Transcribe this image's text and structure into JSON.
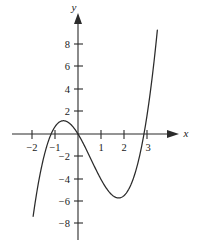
{
  "figure": {
    "background_color": "#ffffff",
    "line_color": "#2b2b2b",
    "axis_color": "#2b2b2b"
  },
  "axes": {
    "x_label": "x",
    "y_label": "y",
    "origin_px": {
      "x": 78,
      "y": 134
    },
    "px_per_unit_x": 23.0,
    "px_per_unit_y": 11.2
  },
  "chart_data": {
    "type": "line",
    "title": "",
    "xlabel": "x",
    "ylabel": "y",
    "grid": false,
    "legend": "none",
    "xlim": [
      -2.1,
      3.7
    ],
    "ylim": [
      -8.6,
      9.4
    ],
    "xticks": [
      -2,
      -1,
      1,
      2,
      3
    ],
    "xtick_labels": [
      "−2",
      "−1",
      "1",
      "2",
      "3"
    ],
    "yticks": [
      8,
      6,
      4,
      2,
      -2,
      -4,
      -6,
      -8
    ],
    "ytick_labels": [
      "8",
      "6",
      "4",
      "2",
      "−2",
      "−4",
      "−6",
      "−8"
    ],
    "series": [
      {
        "name": "cubic",
        "equation": "y = x^3 - 1.7x^2 - 3.35x",
        "domain": [
          -1.95,
          3.45
        ],
        "roots": [
          -1.17,
          0,
          2.87
        ],
        "local_maximum": {
          "x": -0.55,
          "y": 1.1
        },
        "local_minimum": {
          "x": 1.9,
          "y": -6.3
        },
        "x": [
          -1.95,
          -1.8,
          -1.6,
          -1.4,
          -1.17,
          -1.0,
          -0.8,
          -0.55,
          -0.3,
          0.0,
          0.3,
          0.6,
          1.0,
          1.4,
          1.9,
          2.2,
          2.5,
          2.87,
          3.1,
          3.3,
          3.45
        ],
        "y": [
          -7.9,
          -5.8,
          -3.7,
          -2.0,
          0.0,
          0.65,
          1.08,
          1.1,
          0.82,
          0.0,
          -1.13,
          -2.4,
          -4.05,
          -5.27,
          -6.3,
          -6.1,
          -5.1,
          0.0,
          3.1,
          6.0,
          5.95
        ]
      }
    ]
  },
  "tick_marks": {
    "x_tick_px": [
      32,
      55,
      101,
      124,
      147
    ],
    "y_tick_px": [
      44,
      66,
      89,
      111,
      156,
      179,
      201,
      223
    ]
  },
  "labels": {
    "x_axis_labels": [
      {
        "text": "−2",
        "px_x": 32,
        "px_y": 147
      },
      {
        "text": "−1",
        "px_x": 55,
        "px_y": 147
      },
      {
        "text": "1",
        "px_x": 101,
        "px_y": 147
      },
      {
        "text": "2",
        "px_x": 124,
        "px_y": 147
      },
      {
        "text": "3",
        "px_x": 147,
        "px_y": 147
      }
    ],
    "y_axis_labels": [
      {
        "text": "8",
        "px_x": 66,
        "px_y": 44
      },
      {
        "text": "6",
        "px_x": 66,
        "px_y": 66
      },
      {
        "text": "4",
        "px_x": 66,
        "px_y": 89
      },
      {
        "text": "2",
        "px_x": 66,
        "px_y": 111
      },
      {
        "text": "−2",
        "px_x": 64,
        "px_y": 156
      },
      {
        "text": "−4",
        "px_x": 64,
        "px_y": 179
      },
      {
        "text": "−6",
        "px_x": 64,
        "px_y": 201
      },
      {
        "text": "−8",
        "px_x": 64,
        "px_y": 223
      }
    ]
  }
}
